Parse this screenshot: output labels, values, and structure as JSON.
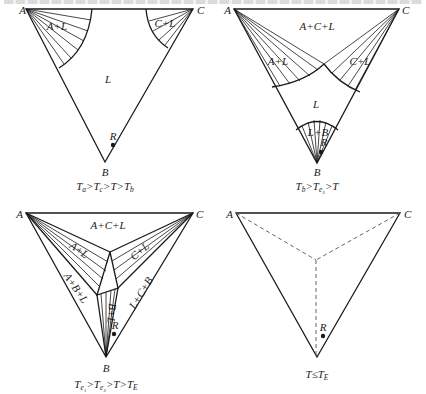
{
  "top_strip": {
    "note": "clipped line of text, glyphs cut off at top edge"
  },
  "panels": [
    {
      "id": "panel-1",
      "vertices": {
        "A": "A",
        "B": "B",
        "C": "C"
      },
      "regions": [
        "A+L",
        "C+L",
        "L"
      ],
      "point": "R",
      "caption": {
        "t1": "T",
        "s1": "a",
        "gt1": ">",
        "t2": "T",
        "s2": "c",
        "gt2": ">",
        "t3": "T",
        "gt3": ">",
        "t4": "T",
        "s4": "b"
      }
    },
    {
      "id": "panel-2",
      "vertices": {
        "A": "A",
        "B": "B",
        "C": "C"
      },
      "regions": [
        "A+C+L",
        "A+L",
        "C+L",
        "L",
        "L+B"
      ],
      "point": "R",
      "caption": {
        "t1": "T",
        "s1": "b",
        "gt1": ">",
        "t2": "T",
        "s2": "e₃",
        "gt2": ">",
        "t3": "T"
      }
    },
    {
      "id": "panel-3",
      "vertices": {
        "A": "A",
        "B": "B",
        "C": "C"
      },
      "regions": [
        "A+C+L",
        "A+L",
        "C+L",
        "A+B+L",
        "L+C+B",
        "B+L"
      ],
      "point": "R",
      "caption": {
        "t1": "T",
        "s1": "e₁",
        "gt1": ">",
        "t2": "T",
        "s2": "e₃",
        "gt2": ">",
        "t3": "T",
        "gt3": ">",
        "t4": "T",
        "s4": "E"
      }
    },
    {
      "id": "panel-4",
      "vertices": {
        "A": "A",
        "C": "C"
      },
      "point": "R",
      "caption": {
        "t1": "T",
        "le": "≤",
        "t2": "T",
        "s2": "E"
      }
    }
  ]
}
